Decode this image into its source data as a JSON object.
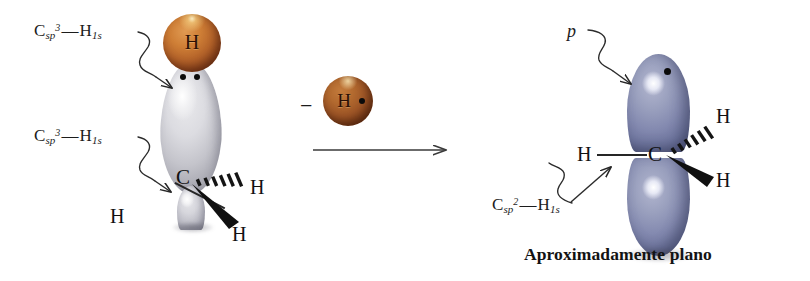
{
  "figure": {
    "caption": "Aproximadamente plano",
    "reaction_operator": "−"
  },
  "colors": {
    "hydrogen_sphere": "#b5642a",
    "hydrogen_sphere_mid": "#9d5526",
    "sp3_lobe_grey": "#d6d6dc",
    "p_lobe_blue": "#848ab0",
    "line": "#262626",
    "text": "#1a1a1a",
    "background": "#ffffff"
  },
  "left_structure": {
    "name": "methane-sp3-carbon",
    "labels": {
      "top_bond": {
        "prefix": "C",
        "sub_hybrid": "sp",
        "sup_hybrid": "3",
        "dash": "—",
        "atom": "H",
        "sub_shell": "1s",
        "plain": "Csp3—H1s"
      },
      "bottom_bond": {
        "prefix": "C",
        "sub_hybrid": "sp",
        "sup_hybrid": "3",
        "dash": "—",
        "atom": "H",
        "sub_shell": "1s",
        "plain": "Csp3—H1s"
      }
    },
    "atoms": {
      "sphere_h": "H",
      "center_c": "C",
      "h_left": "H",
      "h_hashed": "H",
      "h_wedge": "H"
    },
    "electron_pair_dots": 2
  },
  "middle": {
    "name": "hydrogen-radical-removed",
    "minus": "−",
    "atom": "H",
    "radical_dot": "•",
    "arrow": "reaction-arrow-right"
  },
  "right_structure": {
    "name": "methyl-radical-sp2-carbon",
    "labels": {
      "p_orbital": "p",
      "sigma_bond": {
        "prefix": "C",
        "sub_hybrid": "sp",
        "sup_hybrid": "2",
        "dash": "—",
        "atom": "H",
        "sub_shell": "1s",
        "plain": "Csp2—H1s"
      }
    },
    "atoms": {
      "center_c": "C",
      "h_left": "H",
      "h_hashed": "H",
      "h_wedge": "H"
    },
    "radical_dots": 1
  }
}
